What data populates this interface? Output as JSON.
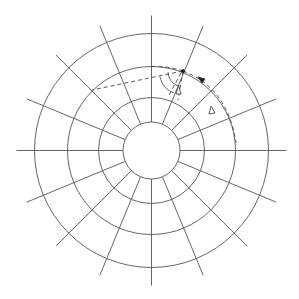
{
  "diagram": {
    "title": "",
    "type": "polar-grid",
    "center": [
      151.5,
      150.5
    ],
    "circle_radii": [
      28.5,
      53,
      84,
      117
    ],
    "ray_count": 16,
    "ray_inner_radius": 28.5,
    "ray_outer_radius": 135,
    "colors": {
      "grid": "#555555",
      "dashed": "#444444",
      "background": "#ffffff"
    },
    "point_p": [
      183,
      71
    ],
    "paths": [
      {
        "name": "dashed-chord-left",
        "from": [
          183,
          71
        ],
        "to": [
          92,
          90
        ]
      },
      {
        "name": "dashed-arc-top",
        "from": [
          151.5,
          66.5
        ],
        "to": [
          183,
          71
        ]
      },
      {
        "name": "dashed-line-down",
        "from": [
          183,
          71
        ],
        "to": [
          178,
          100
        ]
      },
      {
        "name": "dashed-curve-right",
        "from": [
          183,
          71
        ],
        "to": [
          236,
          143
        ]
      }
    ],
    "arrows": [
      {
        "name": "open-arrow-down-path",
        "at": [
          178,
          92
        ],
        "direction": "up"
      },
      {
        "name": "open-arrow-right-curve",
        "at": [
          213,
          111
        ],
        "direction": "up"
      },
      {
        "name": "solid-arrow-along-circle",
        "at": [
          203,
          80
        ],
        "direction": "up-left"
      }
    ]
  }
}
